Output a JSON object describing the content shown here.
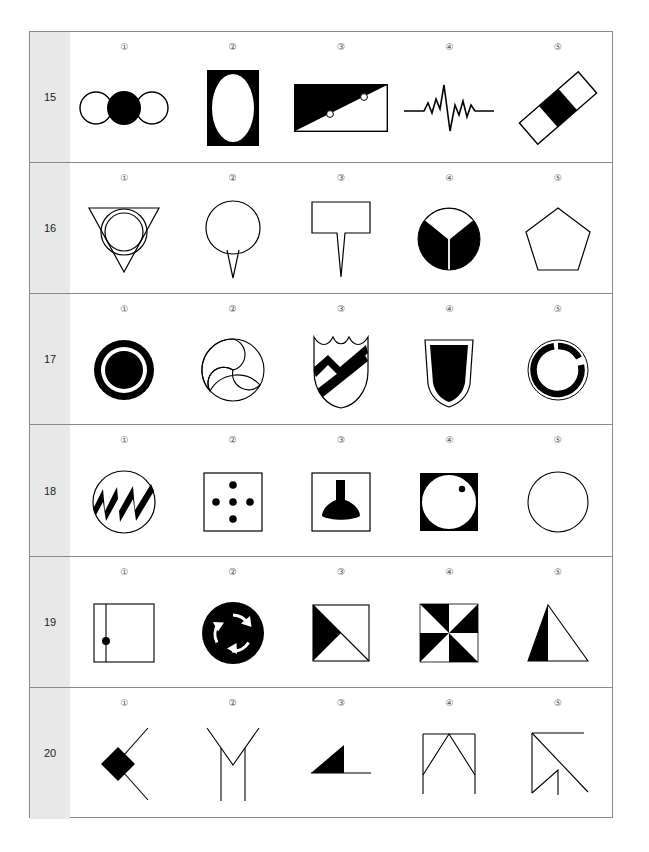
{
  "page": {
    "background_color": "#ffffff",
    "table_border_color": "#8a8a8a",
    "row_label_background": "#e8e8e8",
    "ink_color": "#000000",
    "row_count": 6,
    "column_count": 5
  },
  "column_markers": [
    "①",
    "②",
    "③",
    "④",
    "⑤"
  ],
  "rows": [
    {
      "label": "15",
      "items": [
        {
          "num": "①",
          "name": "three-circles-middle-filled",
          "description": "Three overlapping circles in a horizontal row; the middle circle is solid black, the outer two are outlined white"
        },
        {
          "num": "②",
          "name": "white-ellipse-in-black-rectangle",
          "description": "Black filled vertical rectangle containing a large white ellipse"
        },
        {
          "num": "③",
          "name": "half-filled-rectangle-diagonal-dots",
          "description": "Rectangle split by a diagonal; upper-left triangle filled black, two small white dots sit on the diagonal"
        },
        {
          "num": "④",
          "name": "zigzag-waveform-line",
          "description": "Horizontal line with a jagged spike waveform in the centre"
        },
        {
          "num": "⑤",
          "name": "tilted-three-part-bar",
          "description": "Tilted elongated rectangle divided into three segments; the middle segment is black"
        }
      ]
    },
    {
      "label": "16",
      "items": [
        {
          "num": "①",
          "name": "double-circle-in-down-triangle",
          "description": "Downward pointing triangle with two concentric outlined circles inside"
        },
        {
          "num": "②",
          "name": "circle-with-pin-tail",
          "description": "Outlined circle with a narrow pointed tail extending downward like a pin"
        },
        {
          "num": "③",
          "name": "rectangle-with-pin-tail",
          "description": "Outlined rectangle with a narrow pointed tail extending downward like a plant label"
        },
        {
          "num": "④",
          "name": "black-circle-white-pie-wedge",
          "description": "Black filled circle with a white wedge at the top and thin white radial dividers"
        },
        {
          "num": "⑤",
          "name": "outlined-pentagon",
          "description": "Plain outlined pentagon"
        }
      ]
    },
    {
      "label": "17",
      "items": [
        {
          "num": "①",
          "name": "bullseye-ring-with-disc",
          "description": "Thick black ring with a white gap and a solid black disc at the centre"
        },
        {
          "num": "②",
          "name": "triskelion-swirl-circle",
          "description": "Outlined circle containing three curved swirl arcs like a pinwheel"
        },
        {
          "num": "③",
          "name": "shield-with-lightning-stripes",
          "description": "Shield outline with a scalloped top crossed by a thick lightning/zigzag stripe"
        },
        {
          "num": "④",
          "name": "black-filled-shield-badge",
          "description": "Shield-shaped badge outline with a solid black inner shield"
        },
        {
          "num": "⑤",
          "name": "broken-ring",
          "description": "Thick black ring with two small gaps, inside a thin outlined circle"
        }
      ]
    },
    {
      "label": "18",
      "items": [
        {
          "num": "①",
          "name": "circle-with-black-zigzag",
          "description": "Outlined circle containing a thick black zigzag / sawtooth band"
        },
        {
          "num": "②",
          "name": "square-with-five-dots",
          "description": "Outlined square with five black dots arranged as a plus/quincunx"
        },
        {
          "num": "③",
          "name": "square-with-black-funnel",
          "description": "Outlined square containing a solid black funnel/anvil shape"
        },
        {
          "num": "④",
          "name": "white-circle-in-black-square-with-dot",
          "description": "Black filled square containing a large white circle with a small black dot near its upper right"
        },
        {
          "num": "⑤",
          "name": "plain-outlined-circle",
          "description": "Plain outlined circle"
        }
      ]
    },
    {
      "label": "19",
      "items": [
        {
          "num": "①",
          "name": "square-with-vertical-line-and-dot",
          "description": "Outlined square with a vertical line near the left side and a black dot on that line"
        },
        {
          "num": "②",
          "name": "black-circle-recycling-arrows",
          "description": "Solid black circle with three white curved recycling arrows"
        },
        {
          "num": "③",
          "name": "square-half-black-triangle",
          "description": "Outlined square with the left/upper-left triangle filled black"
        },
        {
          "num": "④",
          "name": "pinwheel-checker-square",
          "description": "Square divided into eight triangles in an alternating black and white pinwheel pattern"
        },
        {
          "num": "⑤",
          "name": "triangle-left-half-black",
          "description": "Outlined triangle whose left half is filled black"
        }
      ]
    },
    {
      "label": "20",
      "items": [
        {
          "num": "①",
          "name": "chevron-with-black-diamond",
          "description": "Open V chevron of thin lines with a solid black diamond at its vertex"
        },
        {
          "num": "②",
          "name": "double-stroke-y-shape",
          "description": "Two long vertical lines rising to meet at a V, forming a Y / M outline"
        },
        {
          "num": "③",
          "name": "black-right-triangle-on-line",
          "description": "Small solid black right triangle sitting on a horizontal baseline"
        },
        {
          "num": "④",
          "name": "square-with-inner-v-peak",
          "description": "Three-sided square outline with an inner V shape hanging from the top centre"
        },
        {
          "num": "⑤",
          "name": "square-with-diagonals-and-stem",
          "description": "Square outline with a long diagonal through it, an inner V and a short vertical stem"
        }
      ]
    }
  ]
}
